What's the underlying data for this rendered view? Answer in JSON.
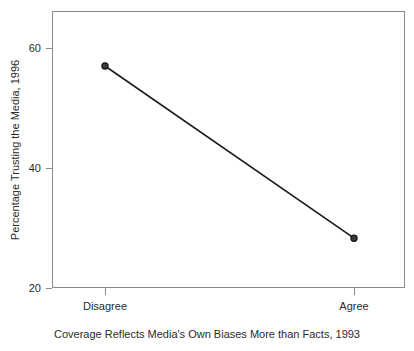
{
  "chart_data": {
    "type": "line",
    "title": "",
    "subtitle": "",
    "xlabel": "Coverage Reflects Media's Own Biases More than Facts, 1993",
    "ylabel": "Percentage Trusting the Media, 1996",
    "categories": [
      "Disagree",
      "Agree"
    ],
    "values": [
      57,
      28.3
    ],
    "series": [
      {
        "name": "Percentage Trusting the Media, 1996",
        "values": [
          57,
          28.3
        ]
      }
    ],
    "x_tick_labels": [
      "Disagree",
      "Agree"
    ],
    "y_tick_labels": [
      "20",
      "40",
      "60"
    ],
    "y_ticks": [
      20,
      40,
      60
    ],
    "ylim": [
      16.5,
      63.8
    ],
    "xlim": [
      0,
      1
    ],
    "grid": false,
    "legend": "none",
    "marker": "filled-circle",
    "line_color": "#1a1a1a",
    "marker_color": "#1a1a1a",
    "axis_color": "#808080",
    "background_color": "#ffffff",
    "text_color": "#2b2b2b",
    "annotations": []
  },
  "axes": {
    "y": {
      "title": "Percentage Trusting the Media, 1996",
      "ticks": [
        {
          "label": "60",
          "value": 60
        },
        {
          "label": "40",
          "value": 40
        },
        {
          "label": "20",
          "value": 20
        }
      ]
    },
    "x": {
      "title": "Coverage Reflects Media's Own Biases More than Facts, 1993",
      "ticks": [
        {
          "label": "Disagree",
          "value": 0
        },
        {
          "label": "Agree",
          "value": 1
        }
      ]
    }
  },
  "points": [
    {
      "category": "Disagree",
      "value": 57
    },
    {
      "category": "Agree",
      "value": 28.3
    }
  ]
}
